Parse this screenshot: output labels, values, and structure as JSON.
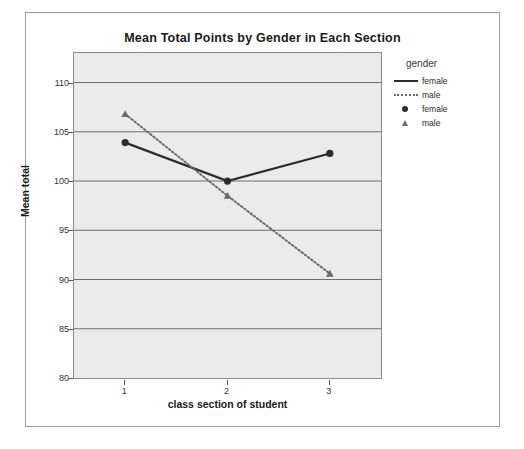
{
  "chart_data": {
    "type": "line",
    "title": "Mean Total Points by Gender in Each Section",
    "xlabel": "class section of student",
    "ylabel": "Mean total",
    "categories": [
      "1",
      "2",
      "3"
    ],
    "x_tick_labels": [
      "1",
      "2",
      "3"
    ],
    "y_tick_labels": [
      "80",
      "85",
      "90",
      "95",
      "100",
      "105",
      "110"
    ],
    "y_ticks": [
      80,
      85,
      90,
      95,
      100,
      105,
      110
    ],
    "ylim": [
      80,
      113
    ],
    "xlim": [
      0.5,
      3.5
    ],
    "grid": "horizontal",
    "legend_position": "right",
    "legend_title": "gender",
    "series": [
      {
        "name": "female",
        "marker": "circle",
        "line_style": "solid",
        "color": "#2c2c2c",
        "values": [
          103.9,
          100.0,
          102.8
        ]
      },
      {
        "name": "male",
        "marker": "triangle",
        "line_style": "dotted",
        "color": "#6a6a6a",
        "values": [
          106.8,
          98.5,
          90.6
        ]
      }
    ]
  },
  "legend": {
    "title": "gender",
    "entries": [
      {
        "label": "female",
        "key": "solid-line-key"
      },
      {
        "label": "male",
        "key": "dotted-line-key"
      },
      {
        "label": "female",
        "key": "circle-marker-key"
      },
      {
        "label": "male",
        "key": "triangle-marker-key"
      }
    ]
  },
  "colors": {
    "plot_background": "#ebebeb",
    "figure_background": "#ffffff",
    "gridline": "#6e6e6e",
    "female_series": "#2c2c2c",
    "male_series": "#6a6a6a",
    "frame": "#8c8c8c"
  }
}
